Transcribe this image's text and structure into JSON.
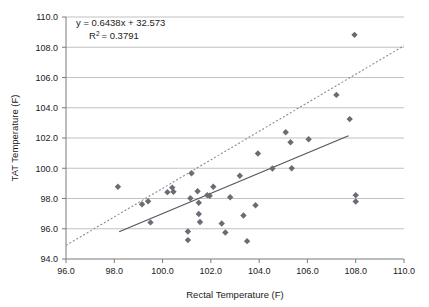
{
  "chart_data": {
    "type": "scatter",
    "title": "",
    "xlabel": "Rectal Temperature (F)",
    "ylabel": "TAT Temperature (F)",
    "xlim": [
      96.0,
      110.0
    ],
    "ylim": [
      94.0,
      110.0
    ],
    "xticks": [
      "96.0",
      "98.0",
      "100.0",
      "102.0",
      "104.0",
      "106.0",
      "108.0",
      "110.0"
    ],
    "yticks": [
      "94.0",
      "96.0",
      "98.0",
      "100.0",
      "102.0",
      "104.0",
      "106.0",
      "108.0",
      "110.0"
    ],
    "xtick_values": [
      96.0,
      98.0,
      100.0,
      102.0,
      104.0,
      106.0,
      108.0,
      110.0
    ],
    "ytick_values": [
      94.0,
      96.0,
      98.0,
      100.0,
      102.0,
      104.0,
      106.0,
      108.0,
      110.0
    ],
    "grid": "horizontal",
    "legend": "none",
    "marker_shape": "diamond",
    "marker_color": "#6b6b75",
    "annotations": {
      "equation": "y = 0.6438x + 32.573",
      "r_squared_label": "R",
      "r_squared_exponent": "2",
      "r_squared_value": "= 0.3791"
    },
    "trendline": {
      "name": "linear fit",
      "style": "solid",
      "color": "#56565f",
      "slope": 0.6438,
      "intercept": 32.573,
      "x_start": 98.2,
      "y_start": 95.8,
      "x_end": 107.7,
      "y_end": 102.15
    },
    "reference_line": {
      "name": "identity line",
      "style": "dotted",
      "color": "#8c8c94",
      "x_start": 96.0,
      "y_start": 94.9,
      "x_end": 110.0,
      "y_end": 108.1
    },
    "points": [
      {
        "x": 98.15,
        "y": 98.78
      },
      {
        "x": 99.15,
        "y": 97.62
      },
      {
        "x": 99.4,
        "y": 97.82
      },
      {
        "x": 99.5,
        "y": 96.42
      },
      {
        "x": 100.2,
        "y": 98.42
      },
      {
        "x": 100.4,
        "y": 98.72
      },
      {
        "x": 100.45,
        "y": 98.45
      },
      {
        "x": 101.05,
        "y": 95.82
      },
      {
        "x": 101.05,
        "y": 95.25
      },
      {
        "x": 101.15,
        "y": 98.02
      },
      {
        "x": 101.2,
        "y": 99.67
      },
      {
        "x": 101.45,
        "y": 98.48
      },
      {
        "x": 101.5,
        "y": 97.72
      },
      {
        "x": 101.5,
        "y": 96.98
      },
      {
        "x": 101.55,
        "y": 96.45
      },
      {
        "x": 101.85,
        "y": 98.22
      },
      {
        "x": 101.95,
        "y": 98.18
      },
      {
        "x": 102.1,
        "y": 98.78
      },
      {
        "x": 102.45,
        "y": 96.35
      },
      {
        "x": 102.6,
        "y": 95.75
      },
      {
        "x": 102.8,
        "y": 98.08
      },
      {
        "x": 103.2,
        "y": 99.5
      },
      {
        "x": 103.35,
        "y": 96.88
      },
      {
        "x": 103.5,
        "y": 95.18
      },
      {
        "x": 103.85,
        "y": 97.55
      },
      {
        "x": 103.95,
        "y": 100.98
      },
      {
        "x": 104.55,
        "y": 99.98
      },
      {
        "x": 105.1,
        "y": 102.38
      },
      {
        "x": 105.3,
        "y": 101.72
      },
      {
        "x": 105.35,
        "y": 100.0
      },
      {
        "x": 106.05,
        "y": 101.92
      },
      {
        "x": 107.2,
        "y": 104.85
      },
      {
        "x": 107.75,
        "y": 103.25
      },
      {
        "x": 107.95,
        "y": 108.82
      },
      {
        "x": 108.0,
        "y": 98.22
      },
      {
        "x": 108.0,
        "y": 97.8
      }
    ]
  }
}
